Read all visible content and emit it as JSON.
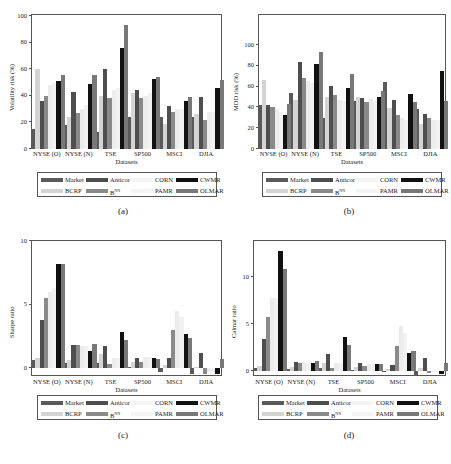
{
  "series_meta": [
    {
      "name": "Market",
      "color": "#5a5a5a"
    },
    {
      "name": "BCRP",
      "color": "#d4d4d4"
    },
    {
      "name": "Anticor",
      "color": "#4e4e4e"
    },
    {
      "name": "BNN",
      "label_base": "B",
      "label_sup": "NN",
      "color": "#8a8a8a"
    },
    {
      "name": "CORN",
      "color": "#ececec"
    },
    {
      "name": "PAMR",
      "color": "#f2f2f2"
    },
    {
      "name": "CWMR",
      "color": "#111111"
    },
    {
      "name": "OLMAR",
      "color": "#787878"
    }
  ],
  "legend": {
    "row1": [
      "Market",
      "Anticor",
      "CORN",
      "CWMR"
    ],
    "row2": [
      "BCRP",
      "B",
      "PAMR",
      "OLMAR"
    ],
    "bnn_sup": "NN"
  },
  "chart_data": [
    {
      "panel": "(a)",
      "type": "bar",
      "title": "",
      "xlabel": "Datasets",
      "ylabel": "Volatility risk (%)",
      "ylim": [
        0,
        100
      ],
      "yticks": [
        0,
        20,
        40,
        60,
        80,
        100
      ],
      "categories": [
        "NYSE (O)",
        "NYSE (N)",
        "TSE",
        "SP500",
        "MSCI",
        "DJIA"
      ],
      "series": [
        {
          "name": "Market",
          "values": [
            15,
            18,
            13,
            24,
            24,
            24
          ]
        },
        {
          "name": "BCRP",
          "values": [
            60,
            24,
            40,
            42,
            19,
            26
          ]
        },
        {
          "name": "Anticor",
          "values": [
            36,
            43,
            60,
            44,
            32,
            39
          ]
        },
        {
          "name": "BNN",
          "values": [
            40,
            27,
            38,
            38,
            28,
            22
          ]
        },
        {
          "name": "CORN",
          "values": [
            48,
            30,
            44,
            40,
            30,
            28
          ]
        },
        {
          "name": "PAMR",
          "values": [
            50,
            33,
            46,
            42,
            30,
            28
          ]
        },
        {
          "name": "CWMR",
          "values": [
            51,
            49,
            76,
            53,
            36,
            46
          ]
        },
        {
          "name": "OLMAR",
          "values": [
            56,
            56,
            93,
            54,
            39,
            52
          ]
        }
      ],
      "grid": false,
      "legend_position": "below"
    },
    {
      "panel": "(b)",
      "type": "bar",
      "title": "",
      "xlabel": "Datasets",
      "ylabel": "MDD risk (%)",
      "ylim": [
        0,
        125
      ],
      "yticks": [
        0,
        20,
        40,
        60,
        80,
        100
      ],
      "categories": [
        "NYSE (O)",
        "NYSE (N)",
        "TSE",
        "SP500",
        "MSCI",
        "DJIA"
      ],
      "series": [
        {
          "name": "Market",
          "values": [
            42,
            54,
            30,
            46,
            64,
            38
          ]
        },
        {
          "name": "BCRP",
          "values": [
            66,
            47,
            50,
            50,
            39,
            24
          ]
        },
        {
          "name": "Anticor",
          "values": [
            42,
            84,
            61,
            49,
            47,
            34
          ]
        },
        {
          "name": "BNN",
          "values": [
            40,
            68,
            52,
            45,
            33,
            30
          ]
        },
        {
          "name": "CORN",
          "values": [
            38,
            65,
            47,
            48,
            30,
            28
          ]
        },
        {
          "name": "PAMR",
          "values": [
            36,
            63,
            46,
            46,
            28,
            28
          ]
        },
        {
          "name": "CWMR",
          "values": [
            33,
            82,
            59,
            50,
            53,
            75
          ]
        },
        {
          "name": "OLMAR",
          "values": [
            43,
            93,
            72,
            56,
            45,
            46
          ]
        }
      ],
      "grid": false,
      "legend_position": "below"
    },
    {
      "panel": "(c)",
      "type": "bar",
      "title": "",
      "xlabel": "Datasets",
      "ylabel": "Sharpe ratio",
      "ylim": [
        -0.7,
        10
      ],
      "yticks": [
        0,
        5,
        10
      ],
      "categories": [
        "NYSE (O)",
        "NYSE (N)",
        "TSE",
        "SP500",
        "MSCI",
        "DJIA"
      ],
      "series": [
        {
          "name": "Market",
          "values": [
            0.6,
            0.4,
            0.4,
            0.1,
            -0.3,
            -0.5
          ]
        },
        {
          "name": "BCRP",
          "values": [
            0.8,
            0.6,
            1.1,
            0.5,
            0.2,
            0.1
          ]
        },
        {
          "name": "Anticor",
          "values": [
            3.8,
            1.8,
            1.7,
            0.8,
            0.8,
            1.2
          ]
        },
        {
          "name": "BNN",
          "values": [
            5.5,
            1.8,
            0.3,
            0.5,
            3.0,
            -0.5
          ]
        },
        {
          "name": "CORN",
          "values": [
            6.0,
            1.7,
            0.8,
            0.9,
            4.5,
            -0.3
          ]
        },
        {
          "name": "PAMR",
          "values": [
            6.3,
            1.7,
            0.8,
            0.9,
            4.0,
            -0.3
          ]
        },
        {
          "name": "CWMR",
          "values": [
            8.2,
            1.3,
            2.8,
            0.8,
            2.7,
            -0.5
          ]
        },
        {
          "name": "OLMAR",
          "values": [
            8.2,
            1.9,
            2.2,
            0.7,
            2.4,
            0.7
          ]
        }
      ],
      "grid": false,
      "legend_position": "below"
    },
    {
      "panel": "(d)",
      "type": "bar",
      "title": "",
      "xlabel": "Datasets",
      "ylabel": "Calmar ratio",
      "ylim": [
        -0.6,
        14
      ],
      "yticks": [
        0,
        5,
        10
      ],
      "categories": [
        "NYSE (O)",
        "NYSE (N)",
        "TSE",
        "SP500",
        "MSCI",
        "DJIA"
      ],
      "series": [
        {
          "name": "Market",
          "values": [
            0.3,
            0.2,
            0.3,
            0.1,
            -0.1,
            -0.4
          ]
        },
        {
          "name": "BCRP",
          "values": [
            0.5,
            0.4,
            0.8,
            0.4,
            0.2,
            0.3
          ]
        },
        {
          "name": "Anticor",
          "values": [
            3.4,
            1.0,
            1.8,
            0.8,
            0.6,
            1.4
          ]
        },
        {
          "name": "BNN",
          "values": [
            5.7,
            0.8,
            0.3,
            0.5,
            2.7,
            -0.2
          ]
        },
        {
          "name": "CORN",
          "values": [
            7.8,
            0.9,
            0.9,
            0.7,
            4.8,
            -0.1
          ]
        },
        {
          "name": "PAMR",
          "values": [
            7.8,
            0.9,
            0.8,
            0.7,
            4.0,
            -0.1
          ]
        },
        {
          "name": "CWMR",
          "values": [
            12.8,
            0.9,
            3.6,
            0.7,
            1.9,
            -0.3
          ]
        },
        {
          "name": "OLMAR",
          "values": [
            10.9,
            1.1,
            2.8,
            0.7,
            2.1,
            0.9
          ]
        }
      ],
      "grid": false,
      "legend_position": "below"
    }
  ]
}
